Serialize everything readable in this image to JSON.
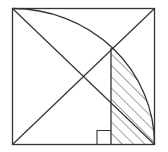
{
  "diagram": {
    "colors": {
      "stroke": "#333333",
      "background": "#ffffff",
      "hatch": "#444444"
    },
    "square": {
      "x1": 12.5,
      "y1": 8.5,
      "x2": 154.5,
      "y2": 144.5
    },
    "vertical_line_x": 111,
    "right_angle_marker_size": 14,
    "hatch_spacing": 8
  }
}
